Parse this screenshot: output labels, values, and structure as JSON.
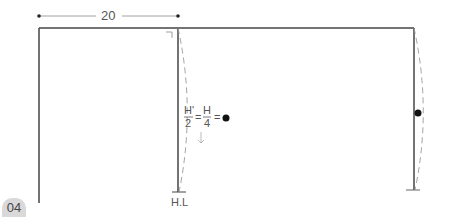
{
  "dimension": {
    "label": "20"
  },
  "formula": {
    "numerator_left": "H'",
    "denominator_left": "2",
    "equals1": "=",
    "numerator_right": "H",
    "denominator_right": "4",
    "equals2": "="
  },
  "hem_label": "H.L",
  "step_badge": "04",
  "footer_text": "...",
  "colors": {
    "line": "#444444",
    "dash": "#999999",
    "text": "#555555",
    "badge": "#d9d9d9"
  }
}
